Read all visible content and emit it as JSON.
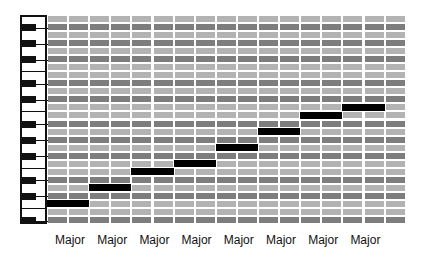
{
  "diagram": {
    "rows": 26,
    "columns": 17,
    "row_pitch_px": 8.04,
    "column_width_px": 21.1,
    "black_key_rows": [
      1,
      3,
      5,
      8,
      10,
      13,
      15,
      17,
      20,
      22,
      25
    ],
    "colors": {
      "white_key_row": "#b3b3b3",
      "black_key_row": "#7d7d7d",
      "gridline": "#ffffff",
      "note": "#000000",
      "keyboard_outline": "#111111"
    },
    "notes": [
      {
        "pitch": "C",
        "row": 23,
        "start_col": 0,
        "length_cols": 2
      },
      {
        "pitch": "D",
        "row": 21,
        "start_col": 2,
        "length_cols": 2
      },
      {
        "pitch": "E",
        "row": 19,
        "start_col": 4,
        "length_cols": 2
      },
      {
        "pitch": "F",
        "row": 18,
        "start_col": 6,
        "length_cols": 2
      },
      {
        "pitch": "G",
        "row": 16,
        "start_col": 8,
        "length_cols": 2
      },
      {
        "pitch": "A",
        "row": 14,
        "start_col": 10,
        "length_cols": 2
      },
      {
        "pitch": "B",
        "row": 12,
        "start_col": 12,
        "length_cols": 2
      },
      {
        "pitch": "C",
        "row": 11,
        "start_col": 14,
        "length_cols": 2
      }
    ],
    "labels": [
      "Major",
      "Major",
      "Major",
      "Major",
      "Major",
      "Major",
      "Major",
      "Major"
    ]
  }
}
